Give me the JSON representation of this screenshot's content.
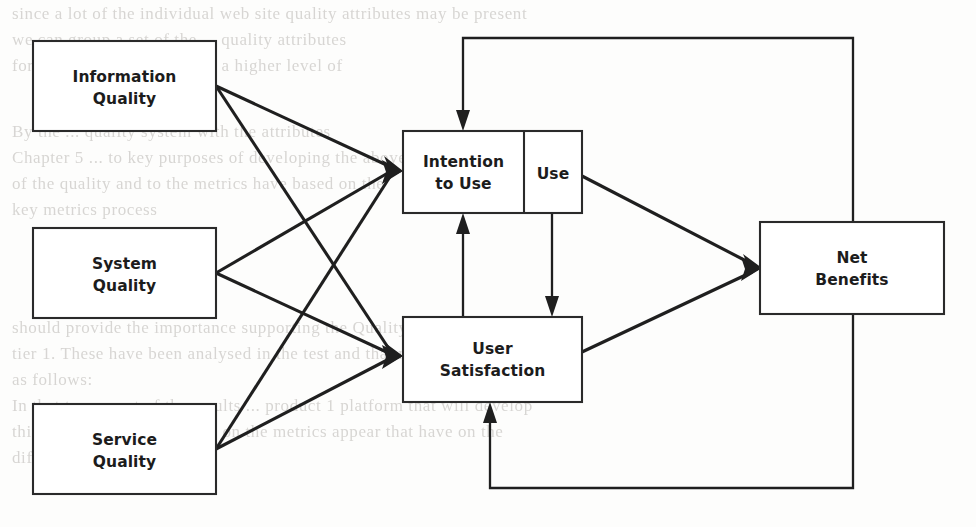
{
  "figure": {
    "type": "diagram",
    "subtype": "path-model",
    "background_note": "faint bleed-through text from reverse side of scanned page",
    "nodes": [
      {
        "id": "information_quality",
        "label_line1": "Information",
        "label_line2": "Quality",
        "x": 33,
        "y": 41,
        "w": 183,
        "h": 90
      },
      {
        "id": "system_quality",
        "label_line1": "System",
        "label_line2": "Quality",
        "x": 33,
        "y": 228,
        "w": 183,
        "h": 90
      },
      {
        "id": "service_quality",
        "label_line1": "Service",
        "label_line2": "Quality",
        "x": 33,
        "y": 404,
        "w": 183,
        "h": 90
      },
      {
        "id": "intention_to_use",
        "label_line1": "Intention",
        "label_line2": "to Use",
        "x": 403,
        "y": 131,
        "w": 121,
        "h": 82
      },
      {
        "id": "use",
        "label_line1": "Use",
        "label_line2": "",
        "x": 524,
        "y": 131,
        "w": 58,
        "h": 82
      },
      {
        "id": "user_satisfaction",
        "label_line1": "User",
        "label_line2": "Satisfaction",
        "x": 403,
        "y": 317,
        "w": 179,
        "h": 85
      },
      {
        "id": "net_benefits",
        "label_line1": "Net",
        "label_line2": "Benefits",
        "x": 760,
        "y": 222,
        "w": 184,
        "h": 92
      }
    ],
    "edges": [
      {
        "from": "information_quality",
        "to": "intention_to_use",
        "style": "straight",
        "arrow": true
      },
      {
        "from": "information_quality",
        "to": "user_satisfaction",
        "style": "straight",
        "arrow": true
      },
      {
        "from": "system_quality",
        "to": "intention_to_use",
        "style": "straight",
        "arrow": true
      },
      {
        "from": "system_quality",
        "to": "user_satisfaction",
        "style": "straight",
        "arrow": true
      },
      {
        "from": "service_quality",
        "to": "intention_to_use",
        "style": "straight",
        "arrow": true
      },
      {
        "from": "service_quality",
        "to": "user_satisfaction",
        "style": "straight",
        "arrow": true
      },
      {
        "from": "user_satisfaction",
        "to": "intention_to_use",
        "style": "vertical-up",
        "arrow": true
      },
      {
        "from": "use",
        "to": "user_satisfaction",
        "style": "vertical-down",
        "arrow": true
      },
      {
        "from": "use",
        "to": "net_benefits",
        "style": "straight",
        "arrow": true
      },
      {
        "from": "user_satisfaction",
        "to": "net_benefits",
        "style": "straight",
        "arrow": true
      },
      {
        "from": "net_benefits",
        "to": "intention_to_use",
        "style": "feedback-top",
        "arrow": true
      },
      {
        "from": "net_benefits",
        "to": "user_satisfaction",
        "style": "feedback-bottom",
        "arrow": true
      }
    ],
    "colors": {
      "box_stroke": "#2a2a2a",
      "box_fill": "#ffffff",
      "edge": "#1f1f1f",
      "label": "#1c1c1c",
      "page": "#fdfdfc",
      "ghost_text": "#b9b6b2"
    }
  },
  "ghost_text": {
    "lines": [
      {
        "text": "since a lot of the individual web site quality attributes may be present",
        "x": 12,
        "y": 4,
        "size": 17
      },
      {
        "text": "we can group a set of the ... quality attributes",
        "x": 12,
        "y": 30,
        "size": 17
      },
      {
        "text": "form to assist developers of a  higher level of",
        "x": 12,
        "y": 56,
        "size": 17
      },
      {
        "text": "By  the ... quality system with the attributes",
        "x": 12,
        "y": 122,
        "size": 17
      },
      {
        "text": "Chapter 5 ... to key  purposes of developing the above of    XM",
        "x": 12,
        "y": 148,
        "size": 17
      },
      {
        "text": "of  the    quality and to   the  metrics  have based on the",
        "x": 12,
        "y": 174,
        "size": 17
      },
      {
        "text": "key metrics process",
        "x": 12,
        "y": 200,
        "size": 17
      },
      {
        "text": "should provide the importance  supporting the   Quality  system",
        "x": 12,
        "y": 318,
        "size": 17
      },
      {
        "text": "tier 1. These   have been analysed in the test and that may  be  the   a shown",
        "x": 12,
        "y": 344,
        "size": 17
      },
      {
        "text": "as follows:",
        "x": 12,
        "y": 370,
        "size": 17
      },
      {
        "text": "In that  to as  most of  the  results  ...  product  1   platform  that  will develop",
        "x": 12,
        "y": 396,
        "size": 17
      },
      {
        "text": "this,  and that  Use   an  impact on  the   metrics   appear   that  have on  the",
        "x": 12,
        "y": 422,
        "size": 17
      },
      {
        "text": "different  quality schema.",
        "x": 12,
        "y": 448,
        "size": 17
      }
    ]
  }
}
